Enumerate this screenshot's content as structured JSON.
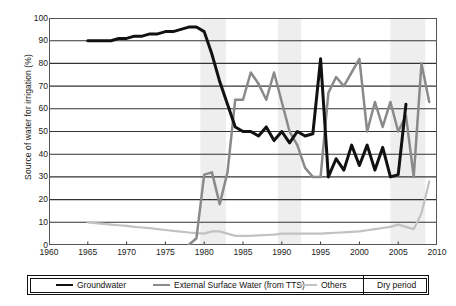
{
  "chart_data": {
    "type": "line",
    "title": "",
    "xlabel": "",
    "ylabel": "Source of water for irrigation (%)",
    "xlim": [
      1960,
      2010
    ],
    "ylim": [
      0,
      100
    ],
    "xticks": [
      1960,
      1965,
      1970,
      1975,
      1980,
      1985,
      1990,
      1995,
      2000,
      2005,
      2010
    ],
    "yticks": [
      0,
      10,
      20,
      30,
      40,
      50,
      60,
      70,
      80,
      90,
      100
    ],
    "grid": "horizontal",
    "legend_position": "bottom",
    "series": [
      {
        "name": "Groundwater",
        "color": "#111111",
        "x": [
          1965,
          1966,
          1967,
          1968,
          1969,
          1970,
          1971,
          1972,
          1973,
          1974,
          1975,
          1976,
          1977,
          1978,
          1979,
          1980,
          1981,
          1982,
          1983,
          1984,
          1985,
          1986,
          1987,
          1988,
          1989,
          1990,
          1991,
          1992,
          1993,
          1994,
          1995,
          1996,
          1997,
          1998,
          1999,
          2000,
          2001,
          2002,
          2003,
          2004,
          2005,
          2006
        ],
        "y": [
          90,
          90,
          90,
          90,
          91,
          91,
          92,
          92,
          93,
          93,
          94,
          94,
          95,
          96,
          96,
          94,
          84,
          72,
          62,
          52,
          50,
          50,
          48,
          52,
          46,
          50,
          45,
          50,
          48,
          49,
          82,
          30,
          38,
          33,
          44,
          35,
          44,
          33,
          43,
          30,
          31,
          62
        ]
      },
      {
        "name": "External Surface Water (from TTS)",
        "color": "#8a8a8a",
        "x": [
          1978,
          1979,
          1980,
          1981,
          1982,
          1983,
          1984,
          1985,
          1986,
          1987,
          1988,
          1989,
          1990,
          1991,
          1992,
          1993,
          1994,
          1995,
          1996,
          1997,
          1998,
          1999,
          2000,
          2001,
          2002,
          2003,
          2004,
          2005,
          2006,
          2007,
          2008,
          2009
        ],
        "y": [
          0,
          3,
          31,
          32,
          18,
          32,
          64,
          64,
          76,
          71,
          64,
          76,
          63,
          50,
          44,
          34,
          30,
          30,
          67,
          74,
          70,
          76,
          82,
          50,
          63,
          52,
          63,
          50,
          57,
          30,
          80,
          63
        ]
      },
      {
        "name": "Others",
        "color": "#c2c2c2",
        "x": [
          1965,
          1966,
          1967,
          1968,
          1969,
          1970,
          1971,
          1972,
          1973,
          1974,
          1975,
          1976,
          1977,
          1978,
          1979,
          1980,
          1981,
          1982,
          1983,
          1984,
          1985,
          1986,
          1987,
          1988,
          1989,
          1990,
          1991,
          1992,
          1993,
          1994,
          1995,
          1996,
          1997,
          1998,
          1999,
          2000,
          2001,
          2002,
          2003,
          2004,
          2005,
          2006,
          2007,
          2008,
          2009
        ],
        "y": [
          10,
          9.6,
          9.3,
          9,
          8.7,
          8.4,
          8,
          7.7,
          7.4,
          7,
          6.6,
          6.2,
          5.9,
          5.5,
          5.2,
          5,
          6,
          6,
          5,
          4,
          4,
          4,
          4.2,
          4.4,
          4.6,
          5,
          5,
          5,
          5,
          5,
          5,
          5.2,
          5.4,
          5.6,
          5.8,
          6,
          6.5,
          7,
          7.5,
          8,
          9,
          8,
          7,
          14,
          28
        ]
      }
    ],
    "dry_periods": [
      {
        "start": 1979.5,
        "end": 1982.8
      },
      {
        "start": 1989.5,
        "end": 1992.5
      },
      {
        "start": 2004.0,
        "end": 2008.5
      }
    ],
    "dry_period_color": "#eeeeee"
  },
  "axis": {
    "y_title": "Source of water for irrigation (%)",
    "y_ticks": [
      "100",
      "90",
      "80",
      "70",
      "60",
      "50",
      "40",
      "30",
      "20",
      "10",
      "0"
    ],
    "x_ticks": [
      "1960",
      "1965",
      "1970",
      "1975",
      "1980",
      "1985",
      "1990",
      "1995",
      "2000",
      "2005",
      "2010"
    ]
  },
  "legend": {
    "items": [
      {
        "label": "Groundwater",
        "swatch": "line-black"
      },
      {
        "label": "External Surface Water (from TTS)",
        "swatch": "line-gray"
      },
      {
        "label": "Others",
        "swatch": "line-lightgray"
      },
      {
        "label": "Dry period",
        "swatch": "shaded-band"
      }
    ]
  }
}
